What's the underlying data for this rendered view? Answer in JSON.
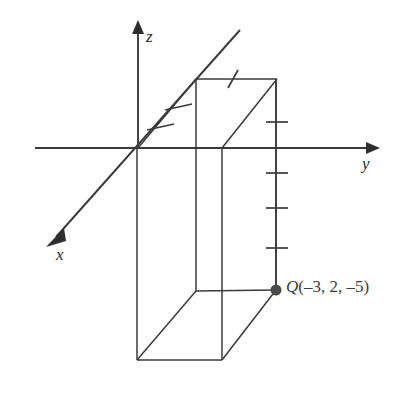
{
  "figure": {
    "type": "3d-coordinate-axes-box-diagram",
    "background_color": "#ffffff",
    "line_color": "#3a3a3a",
    "point_color": "#4a4a4a",
    "width": 411,
    "height": 397
  },
  "axes": {
    "origin": {
      "x": 138,
      "y": 148
    },
    "x_axis": {
      "label": "x",
      "label_position": {
        "x": 56,
        "y": 246
      },
      "start": {
        "x": 240,
        "y": 30
      },
      "end": {
        "x": 50,
        "y": 243
      },
      "arrow_at": "end",
      "tick_count": 2
    },
    "y_axis": {
      "label": "y",
      "label_position": {
        "x": 362,
        "y": 155
      },
      "start": {
        "x": 35,
        "y": 148
      },
      "end": {
        "x": 372,
        "y": 148
      },
      "arrow_at": "end",
      "tick_count": 0
    },
    "z_axis": {
      "label": "z",
      "label_position": {
        "x": 146,
        "y": 28
      },
      "start": {
        "x": 138,
        "y": 148
      },
      "end": {
        "x": 138,
        "y": 28
      },
      "arrow_at": "end",
      "tick_count": 0
    }
  },
  "point": {
    "name": "Q",
    "label": "Q(–3, 2, –5)",
    "coordinates": [
      -3,
      2,
      -5
    ],
    "coordinate_text": "(–3, 2, –5)",
    "dot": {
      "x": 276,
      "y": 290,
      "radius": 5
    }
  },
  "box": {
    "description": "rectangular box from origin to point Q",
    "top_face": {
      "back_left": {
        "x": 196,
        "y": 79
      },
      "back_right": {
        "x": 277,
        "y": 79
      },
      "front_left": {
        "x": 138,
        "y": 148
      },
      "front_right": {
        "x": 222,
        "y": 148
      }
    },
    "bottom_face": {
      "back_left": {
        "x": 196,
        "y": 291
      },
      "back_right": {
        "x": 276,
        "y": 290
      },
      "front_left": {
        "x": 137,
        "y": 360
      },
      "front_right": {
        "x": 222,
        "y": 360
      }
    }
  },
  "tick_marks": {
    "x_axis_ticks": [
      {
        "x": 160,
        "y": 127
      },
      {
        "x": 178,
        "y": 107
      }
    ],
    "top_edge_tick": {
      "x": 232,
      "y": 79
    },
    "vertical_edge_ticks": [
      {
        "x": 276,
        "y": 122
      },
      {
        "x": 276,
        "y": 173
      },
      {
        "x": 276,
        "y": 208
      },
      {
        "x": 276,
        "y": 248
      }
    ]
  }
}
